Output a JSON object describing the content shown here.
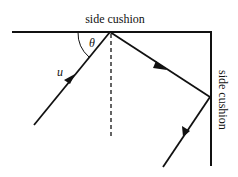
{
  "diagram": {
    "labels": {
      "top_cushion": "side cushion",
      "right_cushion": "side cushion",
      "angle": "θ",
      "velocity": "u"
    },
    "colors": {
      "line": "#111111",
      "background": "#ffffff"
    }
  }
}
